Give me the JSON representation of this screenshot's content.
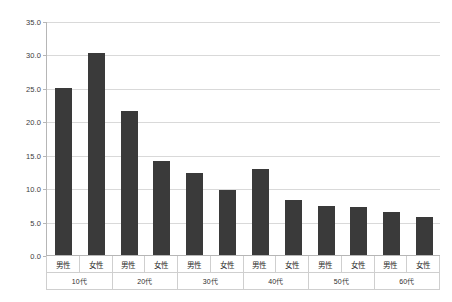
{
  "chart_data": {
    "type": "bar",
    "title": "",
    "xlabel": "",
    "ylabel": "",
    "ylim": [
      0,
      35
    ],
    "y_ticks": [
      "0.0",
      "5.0",
      "10.0",
      "15.0",
      "20.0",
      "25.0",
      "30.0",
      "35.0"
    ],
    "grid": true,
    "legend": "none",
    "bar_color": "#3a3a3a",
    "gridline_color": "#d9d9d9",
    "axis_color": "#b6b6b6",
    "categories": [
      "10代 男性",
      "10代 女性",
      "20代 男性",
      "20代 女性",
      "30代 男性",
      "30代 女性",
      "40代 男性",
      "40代 女性",
      "50代 男性",
      "50代 女性",
      "60代 男性",
      "60代 女性"
    ],
    "values": [
      25.0,
      30.2,
      21.6,
      14.0,
      12.3,
      9.7,
      12.8,
      8.2,
      7.3,
      7.2,
      6.4,
      5.7
    ],
    "groups": [
      {
        "age": "10代",
        "genders": [
          "男性",
          "女性"
        ],
        "values": [
          25.0,
          30.2
        ]
      },
      {
        "age": "20代",
        "genders": [
          "男性",
          "女性"
        ],
        "values": [
          21.6,
          14.0
        ]
      },
      {
        "age": "30代",
        "genders": [
          "男性",
          "女性"
        ],
        "values": [
          12.3,
          9.7
        ]
      },
      {
        "age": "40代",
        "genders": [
          "男性",
          "女性"
        ],
        "values": [
          12.8,
          8.2
        ]
      },
      {
        "age": "50代",
        "genders": [
          "男性",
          "女性"
        ],
        "values": [
          7.3,
          7.2
        ]
      },
      {
        "age": "60代",
        "genders": [
          "男性",
          "女性"
        ],
        "values": [
          6.4,
          5.7
        ]
      }
    ]
  },
  "footer": {
    "clipped_text": ""
  }
}
